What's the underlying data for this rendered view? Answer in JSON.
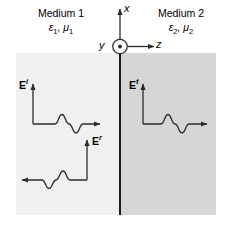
{
  "figure": {
    "background_color": "#ffffff",
    "width": 230,
    "height": 228
  },
  "regions": [
    {
      "id": "medium1",
      "name": "Medium 1",
      "parameters": "ε1, μ1",
      "permittivity": "ε1",
      "permeability": "μ1",
      "fill_color": "#f0f0f0",
      "side": "left"
    },
    {
      "id": "medium2",
      "name": "Medium 2",
      "parameters": "ε2, μ2",
      "permittivity": "ε2",
      "permeability": "μ2",
      "fill_color": "#d6d6d6",
      "side": "right"
    }
  ],
  "boundary": {
    "name": "interface-line",
    "color": "#1a1a1a",
    "orientation": "vertical"
  },
  "axes": {
    "x": {
      "label": "x",
      "direction": "up"
    },
    "y": {
      "label": "y",
      "direction": "out-of-page",
      "glyph": "circle-dot"
    },
    "z": {
      "label": "z",
      "direction": "right"
    },
    "color": "#2b2b2b"
  },
  "waves": [
    {
      "id": "incident",
      "label": "E",
      "superscript": "i",
      "description": "Incident wave in Medium 1 travelling in +z",
      "propagation_direction": "right",
      "region": "medium1"
    },
    {
      "id": "reflected",
      "label": "E",
      "superscript": "r",
      "description": "Reflected wave in Medium 1 travelling in -z",
      "propagation_direction": "left",
      "region": "medium1"
    },
    {
      "id": "transmitted",
      "label": "E",
      "superscript": "t",
      "description": "Transmitted wave in Medium 2 travelling in +z",
      "propagation_direction": "right",
      "region": "medium2"
    }
  ]
}
